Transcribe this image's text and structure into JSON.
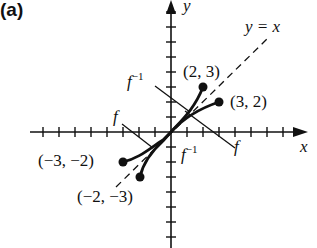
{
  "panel_label": "(a)",
  "axes": {
    "x_label": "x",
    "y_label": "y"
  },
  "identity_line_label": "y = x",
  "curve_labels": {
    "f_left": "f",
    "f_right": "f",
    "finv_top": "f",
    "finv_bottom": "f",
    "inv_exp": "−1"
  },
  "points": [
    {
      "label": "(2, 3)"
    },
    {
      "label": "(3, 2)"
    },
    {
      "label": "(−3, −2)"
    },
    {
      "label": "(−2, −3)"
    }
  ]
}
